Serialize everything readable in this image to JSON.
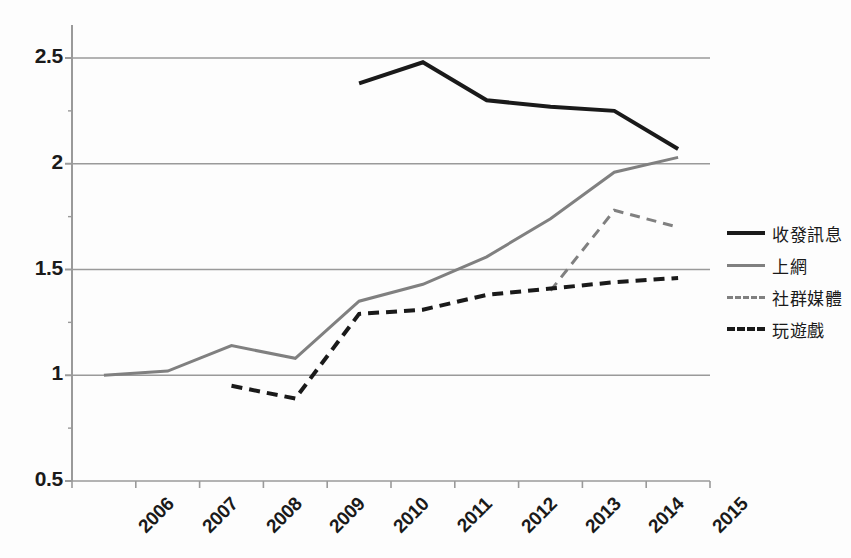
{
  "chart_data": {
    "type": "line",
    "title": "",
    "subtitle": "",
    "xlabel": "",
    "ylabel": "",
    "categories": [
      "2006",
      "2007",
      "2008",
      "2009",
      "2010",
      "2011",
      "2012",
      "2013",
      "2014",
      "2015"
    ],
    "ylim": [
      0.5,
      2.5
    ],
    "yticks": [
      0.5,
      1,
      1.5,
      2,
      2.5
    ],
    "ytick_labels": [
      "0.5",
      "1",
      "1.5",
      "2",
      "2.5"
    ],
    "yminor_ticks": [
      0.75,
      1.25,
      1.75,
      2.25
    ],
    "grid": "horizontal",
    "legend_position": "right",
    "series": [
      {
        "name": "收發訊息",
        "style": "solid",
        "color": "#1a1a1a",
        "width": 4,
        "values": [
          null,
          null,
          null,
          null,
          2.38,
          2.48,
          2.3,
          2.27,
          2.25,
          2.07
        ]
      },
      {
        "name": "上網",
        "style": "solid",
        "color": "#808080",
        "width": 3,
        "values": [
          1.0,
          1.02,
          1.14,
          1.08,
          1.35,
          1.43,
          1.56,
          1.74,
          1.96,
          2.03
        ]
      },
      {
        "name": "社群媒體",
        "style": "dashed",
        "color": "#808080",
        "width": 3,
        "values": [
          null,
          null,
          null,
          null,
          null,
          null,
          null,
          1.4,
          1.78,
          1.7
        ]
      },
      {
        "name": "玩遊戲",
        "style": "dashed",
        "color": "#1a1a1a",
        "width": 4,
        "values": [
          null,
          null,
          0.95,
          0.89,
          1.29,
          1.31,
          1.38,
          1.41,
          1.44,
          1.46
        ]
      }
    ]
  },
  "axes": {
    "y_labels": [
      "2.5",
      "2",
      "1.5",
      "1",
      "0.5"
    ],
    "x_labels": [
      "2006",
      "2007",
      "2008",
      "2009",
      "2010",
      "2011",
      "2012",
      "2013",
      "2014",
      "2015"
    ]
  },
  "legend": {
    "items": [
      {
        "label": "收發訊息",
        "style": "solid",
        "color": "#1a1a1a",
        "width": 4
      },
      {
        "label": "上網",
        "style": "solid",
        "color": "#808080",
        "width": 3
      },
      {
        "label": "社群媒體",
        "style": "dashed",
        "color": "#808080",
        "width": 3
      },
      {
        "label": "玩遊戲",
        "style": "dashed",
        "color": "#1a1a1a",
        "width": 4
      }
    ]
  },
  "colors": {
    "axis": "#9a9a9a",
    "grid": "#9a9a9a",
    "text": "#1a1a1a",
    "background": "#fdfdfd",
    "series_dark": "#1a1a1a",
    "series_gray": "#808080"
  }
}
